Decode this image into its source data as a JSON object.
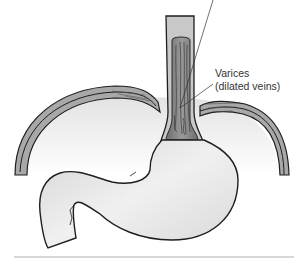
{
  "figure": {
    "structures": [
      "esophagus",
      "diaphragm",
      "stomach",
      "duodenum"
    ],
    "label": {
      "line1": "Varices",
      "line2": "(dilated veins)"
    },
    "colors": {
      "outline": "#1e1e1e",
      "esophagus_wall": "#c8c8c8",
      "esophagus_lumen": "#8a8a8a",
      "diaphragm": "#a8a8a8",
      "stomach_fill": "#e6e6e6",
      "bottom_rule": "#b0b0b0"
    }
  }
}
